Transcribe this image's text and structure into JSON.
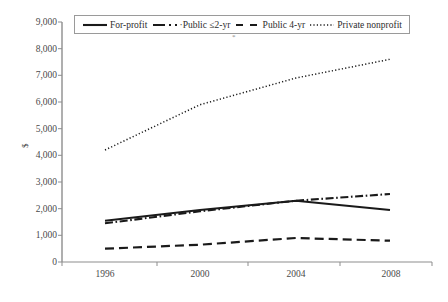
{
  "chart_data": {
    "type": "line",
    "title": "",
    "xlabel": "",
    "ylabel": "$",
    "x": [
      1996,
      2000,
      2004,
      2008
    ],
    "categories": [
      "1996",
      "2000",
      "2004",
      "2008"
    ],
    "xtick_labels": [
      "1996",
      "2000",
      "2004",
      "2008"
    ],
    "ytick_labels": [
      "9,000",
      "8,000",
      "7,000",
      "6,000",
      "5,000",
      "4,000",
      "3,000",
      "2,000",
      "1,000",
      "0"
    ],
    "ytick_values": [
      9000,
      8000,
      7000,
      6000,
      5000,
      4000,
      3000,
      2000,
      1000,
      0
    ],
    "ylim": [
      0,
      9000
    ],
    "xlim": [
      1995,
      2009
    ],
    "grid": false,
    "legend_position": "top",
    "series": [
      {
        "name": "For-profit",
        "style": "solid",
        "color": "#1a1a1a",
        "values": [
          1550,
          1950,
          2300,
          1950
        ]
      },
      {
        "name": "·Public ≤2-yr",
        "style": "dash-dot",
        "color": "#1a1a1a",
        "values": [
          1450,
          1900,
          2300,
          2550
        ]
      },
      {
        "name": "Public 4-yr",
        "style": "dashed",
        "color": "#1a1a1a",
        "values": [
          500,
          650,
          900,
          800
        ]
      },
      {
        "name": "Private nonprofit",
        "style": "dotted",
        "color": "#1a1a1a",
        "values": [
          4200,
          5900,
          6900,
          7600
        ]
      }
    ],
    "annotations": [
      {
        "text": "*",
        "x": 2000,
        "note": "small asterisk below legend box"
      }
    ]
  },
  "axis": {
    "y_title": "$"
  },
  "legend": {
    "items": [
      {
        "label": "For-profit",
        "swatch": "solid-line-icon"
      },
      {
        "label": "·Public ≤2-yr",
        "swatch": "dash-dot-line-icon"
      },
      {
        "label": "Public 4-yr",
        "swatch": "dashed-line-icon"
      },
      {
        "label": "Private nonprofit",
        "swatch": "dotted-line-icon"
      }
    ]
  }
}
